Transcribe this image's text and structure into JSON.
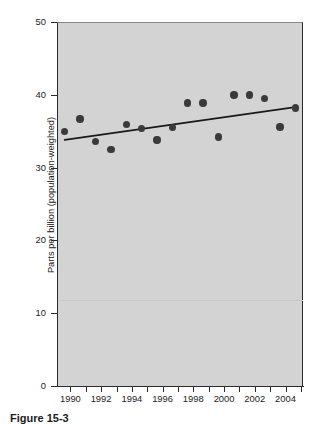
{
  "figure": {
    "caption": "Figure 15-3"
  },
  "chart_data": {
    "type": "scatter",
    "title": "",
    "xlabel": "",
    "ylabel": "Parts per billion (population-weighted)",
    "xlim": [
      1989.5,
      2005.5
    ],
    "ylim": [
      0,
      50
    ],
    "grid": false,
    "legend": null,
    "background_color": "#d3d3d3",
    "marker_color": "#3a3a3a",
    "trend_color": "#1a1a1a",
    "x_tick_labels": [
      "1990",
      "1992",
      "1994",
      "1996",
      "1998",
      "2000",
      "2002",
      "2004"
    ],
    "x_tick_values": [
      1990,
      1992,
      1994,
      1996,
      1998,
      2000,
      2002,
      2004
    ],
    "x_minor_ticks": [
      1991,
      1993,
      1995,
      1997,
      1999,
      2001,
      2003,
      2005
    ],
    "y_tick_labels": [
      "0",
      "10",
      "20",
      "30",
      "40",
      "50"
    ],
    "y_tick_values": [
      0,
      10,
      20,
      30,
      40,
      50
    ],
    "x": [
      1990,
      1991,
      1992,
      1993,
      1994,
      1995,
      1996,
      1997,
      1998,
      1999,
      2000,
      2001,
      2002,
      2003,
      2004,
      2005
    ],
    "values": [
      35.0,
      36.7,
      33.6,
      32.5,
      35.9,
      35.4,
      33.8,
      35.5,
      38.9,
      38.9,
      34.2,
      40.0,
      40.0,
      39.5,
      35.6,
      38.2
    ],
    "series": [
      {
        "name": "Annual observation",
        "x": [
          1990,
          1991,
          1992,
          1993,
          1994,
          1995,
          1996,
          1997,
          1998,
          1999,
          2000,
          2001,
          2002,
          2003,
          2004,
          2005
        ],
        "values": [
          35.0,
          36.7,
          33.6,
          32.5,
          35.9,
          35.4,
          33.8,
          35.5,
          38.9,
          38.9,
          34.2,
          40.0,
          40.0,
          39.5,
          35.6,
          38.2
        ]
      },
      {
        "name": "Trend line",
        "x": [
          1990,
          2005
        ],
        "values": [
          33.8,
          38.3
        ]
      }
    ]
  }
}
